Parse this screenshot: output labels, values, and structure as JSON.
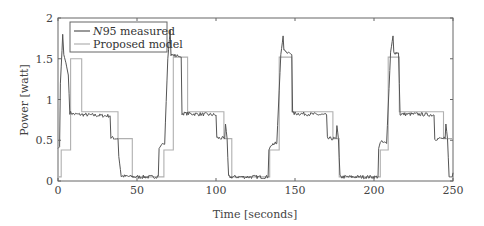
{
  "chart_data": {
    "type": "line",
    "title": "",
    "xlabel": "Time [seconds]",
    "ylabel": "Power [watt]",
    "xlim": [
      0,
      250
    ],
    "ylim": [
      0,
      2
    ],
    "xticks": [
      0,
      50,
      100,
      150,
      200,
      250
    ],
    "yticks": [
      0,
      0.5,
      1,
      1.5,
      2
    ],
    "xtick_labels": [
      "0",
      "50",
      "100",
      "150",
      "200",
      "250"
    ],
    "ytick_labels": [
      "0",
      "0.5",
      "1",
      "1.5",
      "2"
    ],
    "grid": false,
    "legend_position": "upper left",
    "series": [
      {
        "name": "N95 measured",
        "legend_label_italic": "N",
        "legend_label_rest": "95 measured",
        "color": "#555555",
        "style": "noisy",
        "points": [
          [
            0,
            0.4
          ],
          [
            1,
            0.42
          ],
          [
            1.5,
            1.2
          ],
          [
            2.5,
            1.6
          ],
          [
            3,
            1.8
          ],
          [
            3.7,
            1.55
          ],
          [
            5,
            1.45
          ],
          [
            6.5,
            1.3
          ],
          [
            7.5,
            0.84
          ],
          [
            10,
            0.82
          ],
          [
            20,
            0.81
          ],
          [
            30,
            0.8
          ],
          [
            33,
            0.8
          ],
          [
            33.5,
            0.53
          ],
          [
            38,
            0.52
          ],
          [
            38.5,
            0.3
          ],
          [
            40,
            0.06
          ],
          [
            50,
            0.05
          ],
          [
            60,
            0.05
          ],
          [
            63.5,
            0.06
          ],
          [
            64,
            0.4
          ],
          [
            66,
            0.46
          ],
          [
            67.5,
            0.45
          ],
          [
            69.5,
            1.5
          ],
          [
            71,
            1.85
          ],
          [
            71.5,
            1.55
          ],
          [
            76,
            1.53
          ],
          [
            78,
            1.52
          ],
          [
            78.5,
            0.83
          ],
          [
            90,
            0.82
          ],
          [
            100,
            0.81
          ],
          [
            100.5,
            0.53
          ],
          [
            105.5,
            0.52
          ],
          [
            106,
            0.7
          ],
          [
            107,
            0.52
          ],
          [
            108,
            0.05
          ],
          [
            120,
            0.05
          ],
          [
            133,
            0.05
          ],
          [
            133.5,
            0.38
          ],
          [
            135,
            0.45
          ],
          [
            138.5,
            0.46
          ],
          [
            141,
            1.55
          ],
          [
            142.5,
            1.78
          ],
          [
            143,
            1.6
          ],
          [
            146,
            1.58
          ],
          [
            148,
            1.55
          ],
          [
            148.5,
            0.83
          ],
          [
            160,
            0.82
          ],
          [
            170,
            0.81
          ],
          [
            170.5,
            0.52
          ],
          [
            176,
            0.52
          ],
          [
            176.5,
            0.68
          ],
          [
            177.5,
            0.52
          ],
          [
            178.5,
            0.05
          ],
          [
            190,
            0.05
          ],
          [
            202.5,
            0.05
          ],
          [
            203,
            0.4
          ],
          [
            204,
            0.48
          ],
          [
            208,
            0.46
          ],
          [
            210.5,
            1.58
          ],
          [
            212,
            1.78
          ],
          [
            212.5,
            1.58
          ],
          [
            215.5,
            1.57
          ],
          [
            216.5,
            0.82
          ],
          [
            228,
            0.82
          ],
          [
            238,
            0.81
          ],
          [
            238.5,
            0.52
          ],
          [
            245,
            0.52
          ],
          [
            245.5,
            0.7
          ],
          [
            246.5,
            0.52
          ],
          [
            247.5,
            0.05
          ],
          [
            249.5,
            0.05
          ],
          [
            250,
            0.1
          ]
        ]
      },
      {
        "name": "Proposed model",
        "color": "#b0b0b0",
        "style": "step",
        "points": [
          [
            0,
            0.05
          ],
          [
            2,
            0.05
          ],
          [
            2,
            0.38
          ],
          [
            8,
            0.38
          ],
          [
            8,
            1.5
          ],
          [
            15,
            1.5
          ],
          [
            15,
            0.85
          ],
          [
            38,
            0.85
          ],
          [
            38,
            0.52
          ],
          [
            47,
            0.52
          ],
          [
            47,
            0.05
          ],
          [
            67,
            0.05
          ],
          [
            67,
            0.38
          ],
          [
            73,
            0.38
          ],
          [
            73,
            1.52
          ],
          [
            82,
            1.52
          ],
          [
            82,
            0.85
          ],
          [
            105,
            0.85
          ],
          [
            105,
            0.52
          ],
          [
            110,
            0.52
          ],
          [
            110,
            0.05
          ],
          [
            134,
            0.05
          ],
          [
            134,
            0.38
          ],
          [
            140,
            0.38
          ],
          [
            140,
            1.52
          ],
          [
            148,
            1.52
          ],
          [
            148,
            0.85
          ],
          [
            174,
            0.85
          ],
          [
            174,
            0.52
          ],
          [
            178,
            0.52
          ],
          [
            178,
            0.05
          ],
          [
            204,
            0.05
          ],
          [
            204,
            0.38
          ],
          [
            209,
            0.38
          ],
          [
            209,
            1.52
          ],
          [
            216,
            1.52
          ],
          [
            216,
            0.85
          ],
          [
            244,
            0.85
          ],
          [
            244,
            0.52
          ],
          [
            250,
            0.52
          ]
        ]
      }
    ]
  }
}
